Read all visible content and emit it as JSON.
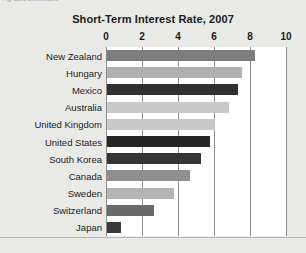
{
  "page": {
    "clipped_text": "Fig 12.1 continued",
    "background_color": "#e9e9e5"
  },
  "chart_data": {
    "type": "bar",
    "orientation": "horizontal",
    "title": "Short-Term Interest Rate, 2007",
    "xlabel": "",
    "ylabel": "",
    "xlim": [
      0,
      10
    ],
    "xticks": [
      0,
      2,
      4,
      6,
      8,
      10
    ],
    "xtick_labels": [
      "0",
      "2",
      "4",
      "6",
      "8",
      "10"
    ],
    "grid": "vertical",
    "legend": "none",
    "categories": [
      "New Zealand",
      "Hungary",
      "Mexico",
      "Australia",
      "United Kingdom",
      "United States",
      "South Korea",
      "Canada",
      "Sweden",
      "Switzerland",
      "Japan"
    ],
    "values": [
      8.2,
      7.5,
      7.3,
      6.8,
      6.0,
      5.7,
      5.2,
      4.6,
      3.7,
      2.6,
      0.75
    ],
    "bar_colors": [
      "#7d7d7d",
      "#b0b0b0",
      "#303030",
      "#c8c8c8",
      "#c8c8c8",
      "#262626",
      "#343434",
      "#8f8f8f",
      "#b4b4b4",
      "#6a6a6a",
      "#3a3a3a"
    ],
    "plot_background": "#ffffff",
    "axis_color": "#8d8d8d"
  }
}
